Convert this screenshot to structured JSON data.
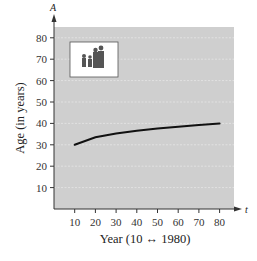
{
  "chart_data": {
    "type": "line",
    "title": "",
    "xlabel": "Year (10 ↔ 1980)",
    "ylabel": "Age (in years)",
    "x_axis_variable": "t",
    "y_axis_variable": "A",
    "xlim": [
      0,
      85
    ],
    "ylim": [
      0,
      85
    ],
    "x_ticks": [
      10,
      20,
      30,
      40,
      50,
      60,
      70,
      80
    ],
    "y_ticks": [
      10,
      20,
      30,
      40,
      50,
      60,
      70,
      80
    ],
    "grid": "horizontal dotted lines",
    "legend": "none",
    "series": [
      {
        "name": "Median age",
        "x": [
          10,
          20,
          30,
          40,
          50,
          60,
          70,
          80
        ],
        "values": [
          30.0,
          33.5,
          35.3,
          36.6,
          37.6,
          38.4,
          39.2,
          39.9
        ]
      }
    ],
    "annotations": [
      "photo of a family (inset image)"
    ]
  },
  "colors": {
    "plot_background": "#cfcfcf",
    "curve": "#111111",
    "axis": "#333333",
    "grid": "#e6e6e6"
  }
}
